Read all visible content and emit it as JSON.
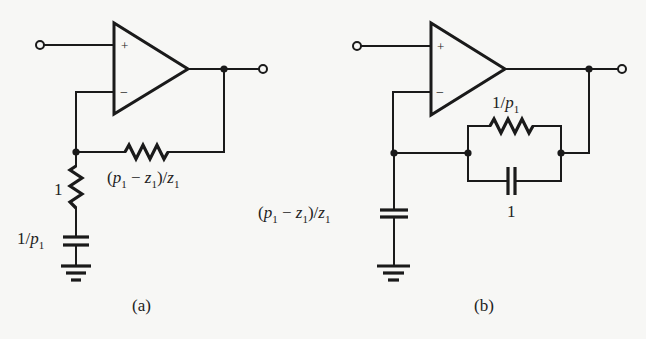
{
  "figure": {
    "background": "#f7f7f5",
    "ink": "#1a1a1a",
    "circuits": [
      {
        "id": "a",
        "caption": "(a)",
        "opamp": {
          "plus": "+",
          "minus": "−"
        },
        "components": [
          {
            "type": "resistor",
            "role": "feedback",
            "label": {
              "open": "(",
              "p": "p",
              "p_sub": "1",
              "minus": " − ",
              "z": "z",
              "z_sub": "1",
              "close": ")/",
              "z2": "z",
              "z2_sub": "1"
            }
          },
          {
            "type": "resistor",
            "role": "shunt",
            "label": {
              "text": "1"
            }
          },
          {
            "type": "capacitor",
            "role": "shunt",
            "label": {
              "num": "1/",
              "p": "p",
              "p_sub": "1"
            }
          },
          {
            "type": "ground"
          }
        ]
      },
      {
        "id": "b",
        "caption": "(b)",
        "opamp": {
          "plus": "+",
          "minus": "−"
        },
        "components": [
          {
            "type": "resistor",
            "role": "feedback-parallel",
            "label": {
              "num": "1/",
              "p": "p",
              "p_sub": "1"
            }
          },
          {
            "type": "capacitor",
            "role": "feedback-parallel",
            "label": {
              "text": "1"
            }
          },
          {
            "type": "capacitor",
            "role": "shunt",
            "label": {
              "open": "(",
              "p": "p",
              "p_sub": "1",
              "minus": " − ",
              "z": "z",
              "z_sub": "1",
              "close": ")/",
              "z2": "z",
              "z2_sub": "1"
            }
          },
          {
            "type": "ground"
          }
        ]
      }
    ]
  }
}
